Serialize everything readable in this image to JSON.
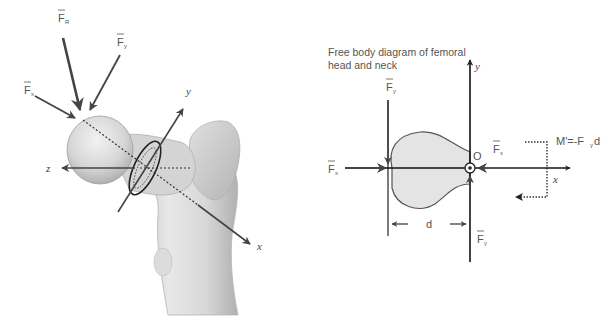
{
  "left_figure": {
    "name": "femur-3d-illustration",
    "force_labels": {
      "fr": {
        "base": "F",
        "sub": "R",
        "bar": true
      },
      "fy": {
        "base": "F",
        "sub": "y",
        "bar": true
      },
      "fx": {
        "base": "F",
        "sub": "x",
        "bar": true
      }
    },
    "axis_labels": {
      "x": "x",
      "y": "y",
      "z": "z"
    }
  },
  "right_figure": {
    "title_line1": "Free body diagram of femoral",
    "title_line2": "head and neck",
    "force_labels": {
      "fy_top": {
        "base": "F",
        "sub": "y",
        "bar": true
      },
      "fx_left": {
        "base": "F",
        "sub": "x",
        "bar": true
      },
      "fx_right": {
        "base": "F",
        "sub": "x",
        "bar": true
      },
      "fy_bottom": {
        "base": "F",
        "sub": "y",
        "bar": true,
        "prime": "'"
      }
    },
    "origin_label": "O",
    "distance_label": "d",
    "axis_labels": {
      "x": "x",
      "y": "y"
    },
    "moment_label": "M'=-F",
    "moment_sub": "y",
    "moment_tail": "d"
  },
  "colors": {
    "background": "#ffffff",
    "bone_light": "#e6e6e6",
    "bone_mid": "#c8c8c8",
    "bone_dark": "#9a9a9a",
    "arrow": "#444444",
    "fbd_fill": "#e4e4e4",
    "text": "#555555"
  }
}
